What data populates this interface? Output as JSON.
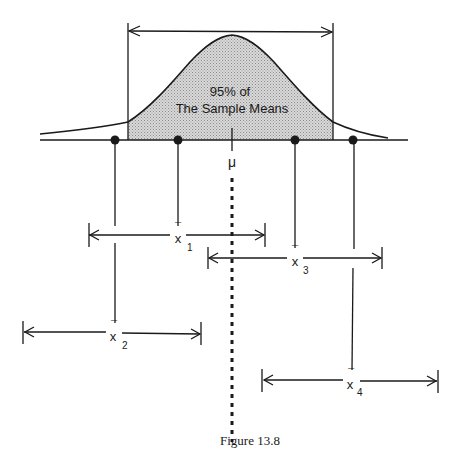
{
  "figure": {
    "caption": "Figure 13.8",
    "curve_label_line1": "95% of",
    "curve_label_line2": "The Sample Means",
    "mean_symbol": "μ",
    "shade_color": "#c8c8c8",
    "ink_color": "#1a1a1a"
  },
  "samples": [
    {
      "id": "x1",
      "symbol": "x",
      "bar": "¯",
      "subscript": "1"
    },
    {
      "id": "x2",
      "symbol": "x",
      "bar": "¯",
      "subscript": "2"
    },
    {
      "id": "x3",
      "symbol": "x",
      "bar": "¯",
      "subscript": "3"
    },
    {
      "id": "x4",
      "symbol": "x",
      "bar": "¯",
      "subscript": "4"
    }
  ]
}
